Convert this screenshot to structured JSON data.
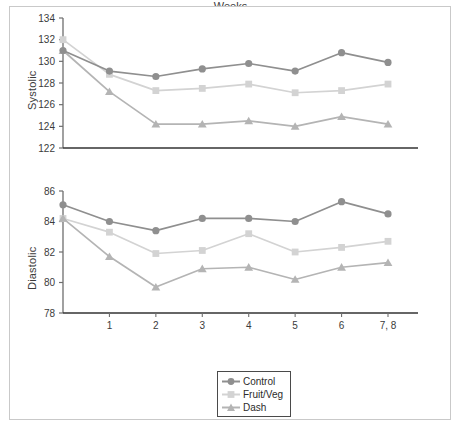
{
  "figure": {
    "xlabel": "Weeks"
  },
  "legend": {
    "items": [
      {
        "label": "Control",
        "marker": "circle",
        "color": "#8f8f8f",
        "icon": "circle-marker-icon"
      },
      {
        "label": "Fruit/Veg",
        "marker": "square",
        "color": "#d3d3d3",
        "icon": "square-marker-icon"
      },
      {
        "label": "Dash",
        "marker": "triangle",
        "color": "#b4b4b4",
        "icon": "triangle-marker-icon"
      }
    ]
  },
  "chart_data": [
    {
      "type": "line",
      "title": "",
      "name": "systolic-panel",
      "xlabel": "",
      "ylabel": "Systolic",
      "x": [
        0,
        1,
        2,
        3,
        4,
        5,
        6,
        7
      ],
      "categories": [
        "",
        "1",
        "2",
        "3",
        "4",
        "5",
        "6",
        "7, 8"
      ],
      "xtick_labels": [
        "1",
        "2",
        "3",
        "4",
        "5",
        "6",
        "7, 8"
      ],
      "ylim": [
        122,
        134
      ],
      "yticks": [
        122,
        124,
        126,
        128,
        130,
        132,
        134
      ],
      "grid": false,
      "legend_position": "bottom-center",
      "series": [
        {
          "name": "Control",
          "color": "#8f8f8f",
          "marker": "circle",
          "values": [
            131.0,
            129.1,
            128.6,
            129.3,
            129.8,
            129.1,
            130.8,
            129.9
          ]
        },
        {
          "name": "Fruit/Veg",
          "color": "#d3d3d3",
          "marker": "square",
          "values": [
            132.0,
            128.8,
            127.3,
            127.5,
            127.9,
            127.1,
            127.3,
            127.9
          ]
        },
        {
          "name": "Dash",
          "color": "#b4b4b4",
          "marker": "triangle",
          "values": [
            131.0,
            127.2,
            124.2,
            124.2,
            124.5,
            124.0,
            124.9,
            124.2
          ]
        }
      ]
    },
    {
      "type": "line",
      "title": "",
      "name": "diastolic-panel",
      "xlabel": "Weeks",
      "ylabel": "Diastolic",
      "x": [
        0,
        1,
        2,
        3,
        4,
        5,
        6,
        7
      ],
      "categories": [
        "",
        "1",
        "2",
        "3",
        "4",
        "5",
        "6",
        "7, 8"
      ],
      "xtick_labels": [
        "1",
        "2",
        "3",
        "4",
        "5",
        "6",
        "7, 8"
      ],
      "ylim": [
        78,
        86
      ],
      "yticks": [
        78,
        80,
        82,
        84,
        86
      ],
      "grid": false,
      "legend_position": "bottom-center",
      "series": [
        {
          "name": "Control",
          "color": "#8f8f8f",
          "marker": "circle",
          "values": [
            85.1,
            84.0,
            83.4,
            84.2,
            84.2,
            84.0,
            85.3,
            84.5
          ]
        },
        {
          "name": "Fruit/Veg",
          "color": "#d3d3d3",
          "marker": "square",
          "values": [
            84.2,
            83.3,
            81.9,
            82.1,
            83.2,
            82.0,
            82.3,
            82.7
          ]
        },
        {
          "name": "Dash",
          "color": "#b4b4b4",
          "marker": "triangle",
          "values": [
            84.2,
            81.7,
            79.7,
            80.9,
            81.0,
            80.2,
            81.0,
            81.3
          ]
        }
      ]
    }
  ]
}
